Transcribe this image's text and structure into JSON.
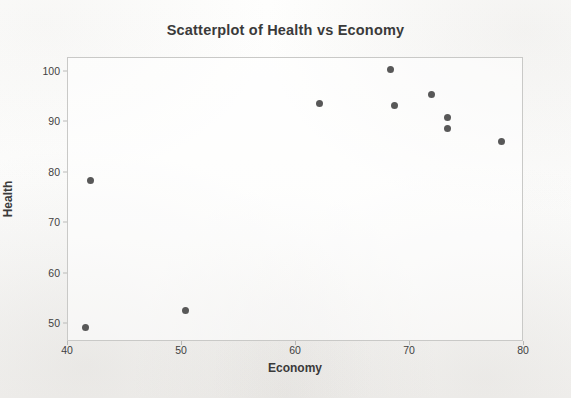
{
  "chart_data": {
    "type": "scatter",
    "title": "Scatterplot of Health vs Economy",
    "xlabel": "Economy",
    "ylabel": "Health",
    "xlim": [
      40,
      80
    ],
    "ylim": [
      47,
      103
    ],
    "xticks": [
      40,
      50,
      60,
      70,
      80
    ],
    "yticks": [
      50,
      60,
      70,
      80,
      90,
      100
    ],
    "grid": false,
    "legend": null,
    "marker_color": "#585858",
    "points": [
      {
        "x": 41.5,
        "y": 49.4
      },
      {
        "x": 42.0,
        "y": 78.4
      },
      {
        "x": 50.3,
        "y": 52.6
      },
      {
        "x": 62.1,
        "y": 93.7
      },
      {
        "x": 68.3,
        "y": 100.4
      },
      {
        "x": 68.6,
        "y": 93.4
      },
      {
        "x": 71.9,
        "y": 95.6
      },
      {
        "x": 73.3,
        "y": 90.9
      },
      {
        "x": 73.3,
        "y": 88.7
      },
      {
        "x": 78.0,
        "y": 86.3
      }
    ]
  },
  "colors": {
    "marker": "#585858",
    "frame": "#c9c9c7",
    "text": "#3a3a3a",
    "page": "#fdfdfc"
  }
}
